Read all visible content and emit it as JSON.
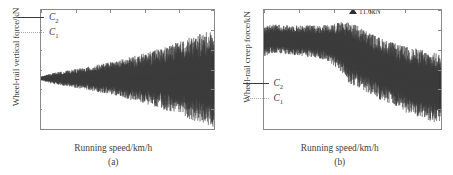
{
  "figure": {
    "panels": [
      {
        "caption": "(a)",
        "xlabel": "Running speed/km/h",
        "ylabel": "Wheel-rail vertical force/kN",
        "legend": [
          {
            "name": "C",
            "sub": "2",
            "style": "solid"
          },
          {
            "name": "C",
            "sub": "1",
            "style": "dotted"
          }
        ],
        "yticks": [
          "0",
          "20",
          "40",
          "60",
          "80",
          "100",
          "120"
        ],
        "xticks": [
          "",
          "50",
          "100",
          "150",
          "200",
          "250"
        ]
      },
      {
        "caption": "(b)",
        "xlabel": "Running speed/km/h",
        "ylabel": "Wheel-rail creep force/kN",
        "legend": [
          {
            "name": "C",
            "sub": "2",
            "style": "solid"
          },
          {
            "name": "C",
            "sub": "1",
            "style": "dotted"
          }
        ],
        "yticks": [
          "0",
          "2",
          "4",
          "6",
          "8",
          "10",
          "12"
        ],
        "xticks": [
          "0",
          "50",
          "100",
          "150",
          "200",
          "250"
        ],
        "annotation": "11.6kN"
      }
    ]
  },
  "chart_data": [
    {
      "type": "line",
      "title": "(a)",
      "xlabel": "Running speed/km/h",
      "ylabel": "Wheel-rail vertical force/kN",
      "xlim": [
        0,
        250
      ],
      "ylim": [
        0,
        120
      ],
      "xticks": [
        0,
        50,
        100,
        150,
        200,
        250
      ],
      "yticks": [
        0,
        20,
        40,
        60,
        80,
        100,
        120
      ],
      "grid": false,
      "legend_position": "upper left",
      "series": [
        {
          "name": "C2",
          "style": "solid",
          "color": "#3a3a3a",
          "description": "Oscillating wheel-rail vertical force with envelope widening with speed",
          "x": [
            0,
            10,
            20,
            30,
            40,
            50,
            60,
            70,
            80,
            90,
            100,
            110,
            120,
            130,
            140,
            150,
            160,
            170,
            180,
            190,
            200,
            210,
            220,
            230,
            240,
            250
          ],
          "mean": [
            51,
            51,
            51,
            51,
            51,
            51,
            51,
            51,
            51,
            51,
            51,
            51,
            51,
            51,
            51,
            51,
            51,
            51,
            51,
            51,
            51,
            51,
            51,
            51,
            51,
            51
          ],
          "envelope_upper": [
            53,
            55,
            57,
            58,
            59,
            61,
            62,
            64,
            66,
            68,
            70,
            72,
            74,
            77,
            79,
            82,
            85,
            88,
            91,
            95,
            98,
            102,
            105,
            108,
            110,
            112
          ],
          "envelope_lower": [
            49,
            47,
            45,
            44,
            43,
            42,
            41,
            40,
            39,
            38,
            37,
            36,
            34,
            33,
            32,
            31,
            30,
            28,
            27,
            25,
            24,
            22,
            20,
            18,
            16,
            14
          ]
        },
        {
          "name": "C1",
          "style": "dotted",
          "color": "#9a9a9a",
          "description": "Narrow band near static wheel load",
          "x": [
            0,
            50,
            100,
            150,
            200,
            250
          ],
          "mean": [
            51,
            51,
            51,
            51,
            51,
            51
          ],
          "envelope_upper": [
            52,
            53,
            53,
            54,
            55,
            56
          ],
          "envelope_lower": [
            50,
            49,
            49,
            48,
            47,
            46
          ]
        }
      ]
    },
    {
      "type": "line",
      "title": "(b)",
      "xlabel": "Running speed/km/h",
      "ylabel": "Wheel-rail creep force/kN",
      "xlim": [
        0,
        250
      ],
      "ylim": [
        0,
        12
      ],
      "xticks": [
        0,
        50,
        100,
        150,
        200,
        250
      ],
      "yticks": [
        0,
        2,
        4,
        6,
        8,
        10,
        12
      ],
      "grid": false,
      "legend_position": "lower left",
      "annotations": [
        {
          "text": "11.6kN",
          "x": 125,
          "y": 11.6
        }
      ],
      "series": [
        {
          "name": "C2",
          "style": "solid",
          "color": "#3a3a3a",
          "description": "Oscillating wheel-rail creep force decreasing with speed",
          "x": [
            0,
            10,
            20,
            30,
            40,
            50,
            60,
            70,
            80,
            90,
            100,
            110,
            120,
            130,
            140,
            150,
            160,
            170,
            180,
            190,
            200,
            210,
            220,
            230,
            240,
            250
          ],
          "mean": [
            8.8,
            9.1,
            9.1,
            9.0,
            9.0,
            8.9,
            8.9,
            8.8,
            8.8,
            8.7,
            8.5,
            8.2,
            7.8,
            7.4,
            7.0,
            6.6,
            6.2,
            5.9,
            5.6,
            5.3,
            5.0,
            4.8,
            4.6,
            4.4,
            4.2,
            4.1
          ],
          "envelope_upper": [
            10.1,
            10.3,
            10.4,
            10.4,
            10.4,
            10.4,
            10.4,
            10.4,
            10.4,
            10.5,
            10.8,
            11.1,
            11.6,
            10.9,
            10.3,
            9.9,
            9.6,
            9.3,
            9.1,
            8.9,
            8.9,
            8.7,
            8.8,
            8.5,
            8.4,
            8.3
          ],
          "envelope_lower": [
            6.9,
            7.4,
            7.5,
            7.5,
            7.4,
            7.3,
            7.2,
            7.1,
            7.0,
            6.8,
            6.4,
            5.9,
            5.2,
            4.6,
            4.1,
            3.7,
            3.3,
            3.0,
            2.7,
            2.5,
            2.2,
            2.0,
            1.8,
            1.6,
            1.4,
            1.3
          ]
        },
        {
          "name": "C1",
          "style": "dotted",
          "color": "#9a9a9a",
          "description": "Smoother creep force band decreasing with speed",
          "x": [
            0,
            25,
            50,
            75,
            100,
            125,
            150,
            175,
            200,
            225,
            250
          ],
          "mean": [
            8.9,
            9.0,
            8.9,
            8.8,
            8.4,
            7.5,
            6.5,
            5.8,
            5.2,
            4.7,
            4.3
          ],
          "envelope_upper": [
            9.6,
            9.7,
            9.6,
            9.5,
            9.2,
            8.4,
            7.3,
            6.5,
            5.9,
            5.4,
            5.0
          ],
          "envelope_lower": [
            8.1,
            8.3,
            8.2,
            8.0,
            7.5,
            6.6,
            5.7,
            5.1,
            4.6,
            4.1,
            3.7
          ]
        }
      ]
    }
  ]
}
